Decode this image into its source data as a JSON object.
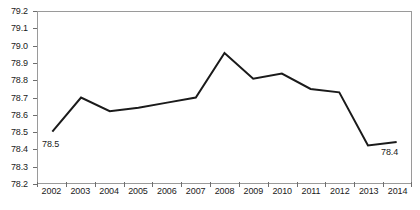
{
  "chart_data": {
    "type": "line",
    "title": "",
    "subtitle": "",
    "xlabel": "",
    "ylabel": "",
    "categories": [
      "2002",
      "2003",
      "2004",
      "2005",
      "2006",
      "2007",
      "2008",
      "2009",
      "2010",
      "2011",
      "2012",
      "2013",
      "2014"
    ],
    "series": [
      {
        "name": "",
        "values": [
          78.5,
          78.7,
          78.62,
          78.64,
          78.67,
          78.7,
          78.96,
          78.81,
          78.84,
          78.75,
          78.73,
          78.42,
          78.44
        ]
      }
    ],
    "ylim": [
      78.2,
      79.2
    ],
    "ytick_step": 0.1,
    "ytick_labels": [
      "79.2",
      "79.1",
      "79.0",
      "78.9",
      "78.8",
      "78.7",
      "78.6",
      "78.5",
      "78.4",
      "78.3",
      "78.2"
    ],
    "ytick_values": [
      79.2,
      79.1,
      79.0,
      78.9,
      78.8,
      78.7,
      78.6,
      78.5,
      78.4,
      78.3,
      78.2
    ],
    "grid": false,
    "legend": false,
    "legend_position": "none",
    "annotations": [
      {
        "name": "first-point-label",
        "text": "78.5",
        "category": "2002",
        "value": 78.5
      },
      {
        "name": "last-point-label",
        "text": "78.4",
        "category": "2014",
        "value": 78.4
      }
    ],
    "colors": {
      "line": "#1a1a1a",
      "axis": "#9a9a9a",
      "tick": "#6e6e6e",
      "text": "#1a1a1a",
      "background": "#ffffff"
    },
    "line_width": 2
  }
}
